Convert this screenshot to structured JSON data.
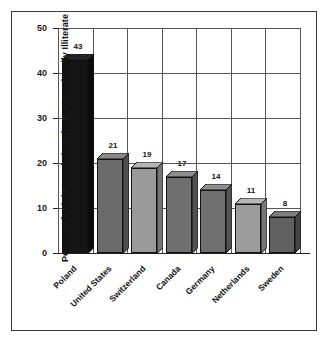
{
  "chart_data": {
    "type": "bar",
    "title": "",
    "subtitle": "",
    "xlabel": "",
    "ylabel": "Percent of Adult Population That Is Functionally Illiterate",
    "categories": [
      "Poland",
      "United States",
      "Switzerland",
      "Canada",
      "Germany",
      "Netherlands",
      "Sweden"
    ],
    "values": [
      43,
      21,
      19,
      17,
      14,
      11,
      8
    ],
    "value_labels": [
      "43",
      "21",
      "19",
      "17",
      "14",
      "11",
      "8"
    ],
    "ylim": [
      0,
      50
    ],
    "ytick_labels": [
      "0",
      "10",
      "20",
      "30",
      "40",
      "50"
    ],
    "ytick_values": [
      0,
      10,
      20,
      30,
      40,
      50
    ],
    "grid": "horizontal-and-vertical",
    "legend": "none",
    "style": "3d-bars",
    "bar_colors": [
      "#151515",
      "#6b6b6b",
      "#9a9a9a",
      "#6f6f6f",
      "#707070",
      "#9c9c9c",
      "#606060"
    ],
    "bar_top_colors": [
      "#262626",
      "#8a8a8a",
      "#b4b4b4",
      "#8d8d8d",
      "#8e8e8e",
      "#b6b6b6",
      "#7d7d7d"
    ],
    "bar_side_colors": [
      "#0b0b0b",
      "#4f4f4f",
      "#757575",
      "#525252",
      "#535353",
      "#777777",
      "#454545"
    ],
    "grid_color": "#555555",
    "axis_color": "#222222",
    "frame_color": "#3a3a3a",
    "background": "#ffffff"
  }
}
